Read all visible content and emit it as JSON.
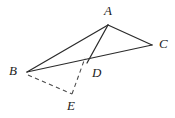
{
  "figure": {
    "name": "triangle-abc-with-cevian-and-reflection",
    "background_color": "#ffffff",
    "width": 175,
    "height": 118,
    "stroke_color": "#2b2b2b",
    "dashed_stroke_color": "#4a4a4a"
  },
  "points": {
    "A": {
      "label": "A",
      "x": 108,
      "y": 25,
      "label_x": 104,
      "label_y": 4
    },
    "B": {
      "label": "B",
      "x": 27,
      "y": 72,
      "label_x": 9,
      "label_y": 64
    },
    "C": {
      "label": "C",
      "x": 152,
      "y": 45,
      "label_x": 159,
      "label_y": 37
    },
    "D": {
      "label": "D",
      "x": 88,
      "y": 65,
      "label_x": 92,
      "label_y": 66
    },
    "E": {
      "label": "E",
      "x": 72,
      "y": 94,
      "label_x": 67,
      "label_y": 99
    }
  },
  "segments": [
    {
      "name": "segment-AB",
      "from": "A",
      "to": "B",
      "style": "solid"
    },
    {
      "name": "segment-AC",
      "from": "A",
      "to": "C",
      "style": "solid"
    },
    {
      "name": "segment-AD",
      "from": "A",
      "to": "D",
      "style": "solid"
    },
    {
      "name": "segment-BC",
      "from": "B",
      "to": "C",
      "style": "solid"
    },
    {
      "name": "segment-BE",
      "from": "B",
      "to": "E",
      "style": "dashed"
    },
    {
      "name": "segment-ED",
      "from": "E",
      "to": "D",
      "style": "dashed"
    }
  ],
  "paths": {
    "AB": "M 108 25 L 27 72",
    "AC": "M 108 25 L 152 45",
    "AD": "M 108 25 L 87 63",
    "BC": "M 27 72 L 152 45",
    "BE": "M 28 75 L 72 94",
    "ED": "M 72 94 L 85 58"
  }
}
